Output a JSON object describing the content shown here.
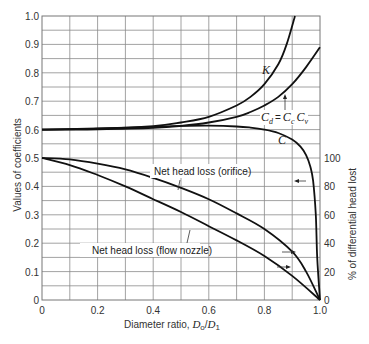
{
  "chart_data": {
    "type": "line",
    "title": "",
    "xlabel": "Diameter ratio, D_o / D_1",
    "xlabel_parts": {
      "text": "Diameter ratio, ",
      "sym": "D",
      "sub1": "o",
      "slash": "/",
      "sym2": "D",
      "sub2": "1"
    },
    "ylabel": "Values of coefficients",
    "ylabel_right": "% of differential head lost",
    "xlim": [
      0,
      1.0
    ],
    "ylim": [
      0,
      1.0
    ],
    "ylim_right": [
      0,
      100
    ],
    "grid": true,
    "x_ticks": [
      "0",
      "0.2",
      "0.4",
      "0.6",
      "0.8",
      "1.0"
    ],
    "y_ticks": [
      "0",
      "0.1",
      "0.2",
      "0.3",
      "0.4",
      "0.5",
      "0.6",
      "0.7",
      "0.8",
      "0.9",
      "1.0"
    ],
    "y_ticks_right": [
      "0",
      "20",
      "40",
      "60",
      "80",
      "100"
    ],
    "series": [
      {
        "name": "K",
        "axis": "left",
        "x": [
          0,
          0.2,
          0.4,
          0.5,
          0.6,
          0.7,
          0.75,
          0.8,
          0.85,
          0.88,
          0.91
        ],
        "y": [
          0.6,
          0.603,
          0.612,
          0.625,
          0.645,
          0.685,
          0.715,
          0.76,
          0.83,
          0.9,
          1.0
        ]
      },
      {
        "name": "C_d = C_c C_v",
        "axis": "left",
        "x": [
          0,
          0.2,
          0.4,
          0.5,
          0.6,
          0.7,
          0.75,
          0.8,
          0.85,
          0.9,
          0.95,
          1.0
        ],
        "y": [
          0.6,
          0.601,
          0.606,
          0.613,
          0.625,
          0.645,
          0.662,
          0.685,
          0.715,
          0.76,
          0.82,
          0.89
        ]
      },
      {
        "name": "C",
        "axis": "left",
        "x": [
          0,
          0.2,
          0.4,
          0.5,
          0.6,
          0.7,
          0.75,
          0.8,
          0.85,
          0.9,
          0.93,
          0.95,
          0.965,
          0.975,
          0.985,
          0.99,
          1.0
        ],
        "y": [
          0.6,
          0.604,
          0.61,
          0.613,
          0.614,
          0.611,
          0.607,
          0.6,
          0.588,
          0.565,
          0.54,
          0.51,
          0.47,
          0.42,
          0.3,
          0.15,
          0.0
        ]
      },
      {
        "name": "Net head loss (orifice)",
        "axis": "right",
        "x": [
          0,
          0.1,
          0.2,
          0.3,
          0.4,
          0.5,
          0.6,
          0.7,
          0.8,
          0.9,
          0.95,
          1.0
        ],
        "y": [
          100,
          99,
          96,
          92,
          86,
          79,
          71,
          61,
          50,
          34,
          20,
          0
        ]
      },
      {
        "name": "Net head loss (flow nozzle)",
        "axis": "right",
        "x": [
          0,
          0.1,
          0.2,
          0.3,
          0.4,
          0.5,
          0.6,
          0.7,
          0.8,
          0.9,
          1.0
        ],
        "y": [
          100,
          95,
          88,
          80,
          71,
          62,
          52,
          42,
          31,
          17,
          0
        ]
      }
    ],
    "annotations": [
      {
        "text": "K",
        "style": "italic"
      },
      {
        "text": "C_d = C_c C_v",
        "style": "italic"
      },
      {
        "text": "C",
        "style": "italic"
      },
      {
        "text": "Net head loss (orifice)"
      },
      {
        "text": "Net head loss (flow nozzle)"
      }
    ]
  },
  "labels": {
    "K": "K",
    "C": "C",
    "Cd_main": "C",
    "Cd_sub": "d",
    "eq": "=",
    "Cc_main": "C",
    "Cc_sub": "c",
    "Cv_main": "C",
    "Cv_sub": "v",
    "orifice": "Net head loss (orifice)",
    "nozzle": "Net head loss (flow nozzle)"
  }
}
